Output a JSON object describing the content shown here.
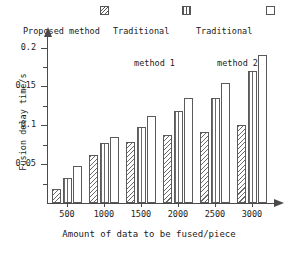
{
  "legend": {
    "entries": [
      {
        "label": "Proposed method",
        "swatch": "hatch-swatch-icon"
      },
      {
        "label": "Traditional",
        "label2": "method 1",
        "swatch": "vertical-lines-swatch-icon"
      },
      {
        "label": "Traditional",
        "label2": "method 2",
        "swatch": "empty-swatch-icon"
      }
    ]
  },
  "chart_data": {
    "type": "bar",
    "title": "",
    "xlabel": "Amount of data to be fused/piece",
    "ylabel": "Fusion delay time/s",
    "categories": [
      "500",
      "1000",
      "1500",
      "2000",
      "2500",
      "3000"
    ],
    "series": [
      {
        "name": "Proposed method",
        "values": [
          0.018,
          0.062,
          0.078,
          0.087,
          0.092,
          0.1
        ]
      },
      {
        "name": "Traditional method 1",
        "values": [
          0.032,
          0.077,
          0.098,
          0.118,
          0.135,
          0.17
        ]
      },
      {
        "name": "Traditional method 2",
        "values": [
          0.048,
          0.085,
          0.112,
          0.135,
          0.155,
          0.19
        ]
      }
    ],
    "ylim": [
      0,
      0.215
    ],
    "ytick_labels": [
      "0.05",
      "0.1",
      "0.15",
      "0.2"
    ],
    "ytick_values": [
      0.05,
      0.1,
      0.15,
      0.2
    ],
    "yminor_values": [
      0.025,
      0.075,
      0.125,
      0.175
    ],
    "grid": false,
    "legend_position": "top"
  }
}
